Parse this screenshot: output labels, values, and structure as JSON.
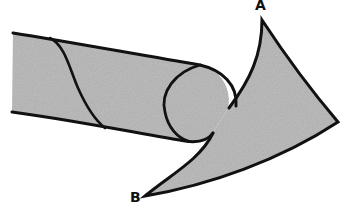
{
  "diagram": {
    "type": "twisted-arrow-illustration",
    "labels": {
      "a": "A",
      "b": "B"
    },
    "colors": {
      "fill": "#b8b8b8",
      "stroke": "#111111",
      "background": "#ffffff"
    }
  }
}
